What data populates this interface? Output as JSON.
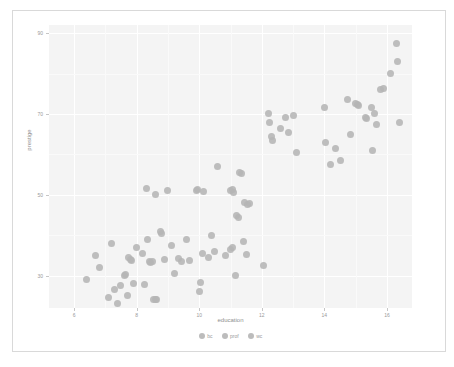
{
  "figure": {
    "background": "#ffffff",
    "panel_background": "#f4f4f4",
    "grid_color": "#ffffff",
    "point_color": "#b5b5b5"
  },
  "chart_data": {
    "type": "scatter",
    "title": "",
    "xlabel": "education",
    "ylabel": "prestige",
    "xlim": [
      5.2,
      16.8
    ],
    "ylim": [
      22,
      92
    ],
    "xticks": [
      6,
      8,
      10,
      12,
      14,
      16
    ],
    "yticks": [
      30,
      50,
      70,
      90
    ],
    "xticklabels": [
      "6",
      "8",
      "10",
      "12",
      "14",
      "16"
    ],
    "yticklabels": [
      "30",
      "50",
      "70",
      "90"
    ],
    "grid": true,
    "legend_position": "bottom",
    "legend": [
      {
        "label": "bc",
        "color": "#b5b5b5"
      },
      {
        "label": "prof",
        "color": "#b5b5b5"
      },
      {
        "label": "wc",
        "color": "#b5b5b5"
      }
    ],
    "series": [
      {
        "name": "bc",
        "color": "#b5b5b5",
        "points": [
          [
            6.4,
            29.0
          ],
          [
            6.7,
            35.0
          ],
          [
            6.8,
            32.0
          ],
          [
            7.2,
            38.0
          ],
          [
            7.1,
            24.5
          ],
          [
            7.3,
            26.5
          ],
          [
            7.4,
            23.0
          ],
          [
            7.5,
            27.5
          ],
          [
            7.6,
            30.0
          ],
          [
            7.65,
            30.2
          ],
          [
            7.7,
            25.0
          ],
          [
            7.75,
            34.5
          ],
          [
            7.8,
            34.0
          ],
          [
            7.85,
            33.8
          ],
          [
            7.9,
            28.0
          ],
          [
            8.0,
            37.0
          ],
          [
            8.2,
            35.5
          ],
          [
            8.25,
            27.8
          ],
          [
            8.35,
            39.0
          ],
          [
            8.4,
            33.5
          ],
          [
            8.45,
            33.2
          ],
          [
            8.5,
            33.4
          ],
          [
            8.55,
            24.0
          ],
          [
            8.6,
            24.2
          ],
          [
            8.65,
            24.1
          ],
          [
            8.75,
            41.0
          ],
          [
            8.8,
            40.5
          ],
          [
            8.9,
            34.0
          ],
          [
            9.1,
            37.5
          ],
          [
            9.2,
            30.5
          ],
          [
            9.35,
            34.2
          ],
          [
            9.45,
            33.5
          ],
          [
            9.6,
            39.0
          ],
          [
            9.7,
            33.8
          ],
          [
            10.0,
            26.0
          ],
          [
            10.05,
            28.2
          ],
          [
            10.1,
            35.5
          ],
          [
            10.3,
            34.5
          ],
          [
            10.5,
            36.0
          ],
          [
            10.85,
            35.0
          ],
          [
            11.0,
            36.5
          ],
          [
            11.05,
            37.0
          ],
          [
            11.15,
            30.0
          ],
          [
            11.4,
            38.5
          ],
          [
            11.5,
            35.2
          ],
          [
            12.05,
            32.5
          ]
        ]
      },
      {
        "name": "prof",
        "color": "#b5b5b5",
        "points": [
          [
            12.2,
            70.0
          ],
          [
            12.25,
            68.0
          ],
          [
            12.3,
            64.5
          ],
          [
            12.35,
            63.5
          ],
          [
            12.6,
            66.5
          ],
          [
            12.75,
            69.0
          ],
          [
            12.85,
            65.5
          ],
          [
            13.0,
            69.5
          ],
          [
            13.1,
            60.5
          ],
          [
            14.0,
            71.5
          ],
          [
            14.05,
            63.0
          ],
          [
            14.2,
            57.5
          ],
          [
            14.35,
            61.5
          ],
          [
            14.5,
            58.5
          ],
          [
            14.75,
            73.5
          ],
          [
            14.85,
            65.0
          ],
          [
            15.0,
            72.5
          ],
          [
            15.05,
            72.3
          ],
          [
            15.1,
            72.0
          ],
          [
            15.3,
            69.0
          ],
          [
            15.35,
            68.8
          ],
          [
            15.5,
            71.5
          ],
          [
            15.55,
            61.0
          ],
          [
            15.6,
            70.0
          ],
          [
            15.65,
            67.5
          ],
          [
            15.8,
            76.0
          ],
          [
            15.9,
            76.2
          ],
          [
            16.1,
            80.0
          ],
          [
            16.3,
            87.5
          ],
          [
            16.35,
            83.0
          ],
          [
            16.4,
            68.0
          ]
        ]
      },
      {
        "name": "wc",
        "color": "#b5b5b5",
        "points": [
          [
            10.6,
            57.0
          ],
          [
            11.0,
            51.0
          ],
          [
            11.05,
            51.2
          ],
          [
            11.1,
            50.5
          ],
          [
            11.2,
            45.0
          ],
          [
            11.25,
            44.5
          ],
          [
            11.3,
            55.5
          ],
          [
            11.35,
            55.2
          ],
          [
            11.45,
            48.0
          ],
          [
            11.55,
            47.5
          ],
          [
            11.6,
            47.8
          ],
          [
            9.9,
            51.0
          ],
          [
            9.95,
            51.2
          ],
          [
            10.15,
            50.8
          ],
          [
            8.3,
            51.5
          ],
          [
            8.6,
            50.0
          ],
          [
            9.0,
            51.0
          ],
          [
            10.4,
            40.0
          ]
        ]
      }
    ]
  }
}
